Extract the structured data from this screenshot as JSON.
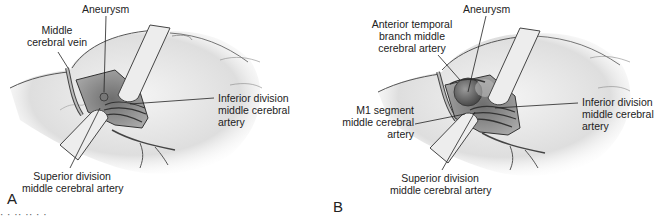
{
  "figure": {
    "caption_fragment": "· ·   ·· ·· ·   ·",
    "panels": [
      {
        "id": "A",
        "letter": "A",
        "labels": {
          "aneurysm": "Aneurysm",
          "mcv_line1": "Middle",
          "mcv_line2": "cerebral vein",
          "inf_line1": "Inferior division",
          "inf_line2": "middle cerebral",
          "inf_line3": "artery",
          "sup_line1": "Superior division",
          "sup_line2": "middle cerebral artery"
        }
      },
      {
        "id": "B",
        "letter": "B",
        "labels": {
          "aneurysm": "Aneurysm",
          "atb_line1": "Anterior temporal",
          "atb_line2": "branch middle",
          "atb_line3": "cerebral artery",
          "m1_line1": "M1 segment",
          "m1_line2": "middle cerebral",
          "m1_line3": "artery",
          "inf_line1": "Inferior division",
          "inf_line2": "middle cerebral",
          "inf_line3": "artery",
          "sup_line1": "Superior division",
          "sup_line2": "middle cerebral artery"
        }
      }
    ]
  }
}
